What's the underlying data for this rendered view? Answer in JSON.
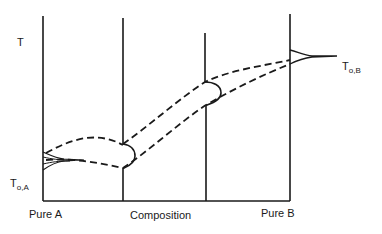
{
  "diagram": {
    "type": "binary-phase-diagram-schematic",
    "y_axis_label": "T",
    "x_axis_label": "Composition",
    "left_endpoint_label": "Pure A",
    "right_endpoint_label": "Pure B",
    "melting_point_A": {
      "main": "T",
      "subscript": "o,A"
    },
    "melting_point_B": {
      "main": "T",
      "subscript": "o,B"
    },
    "curves": [
      {
        "name": "liquidus",
        "style": "dashed"
      },
      {
        "name": "solidus",
        "style": "dashed"
      }
    ],
    "composition_lines": [
      {
        "name": "pure-A-line",
        "composition": 0.0
      },
      {
        "name": "intermediate-composition-1",
        "composition": 0.32
      },
      {
        "name": "intermediate-composition-2",
        "composition": 0.66
      },
      {
        "name": "pure-B-line",
        "composition": 1.0
      }
    ],
    "colors": {
      "ink": "#1a1a1a",
      "background": "#ffffff"
    }
  }
}
